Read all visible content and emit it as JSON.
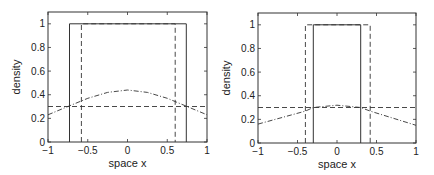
{
  "chart_data": [
    {
      "type": "line",
      "title": "",
      "xlabel": "space x",
      "ylabel": "density",
      "xlim": [
        -1,
        1
      ],
      "ylim": [
        0,
        1.1
      ],
      "xticks": [
        -1,
        -0.5,
        0,
        0.5,
        1
      ],
      "xtick_labels": [
        "−1",
        "−0.5",
        "0",
        "0.5",
        "1"
      ],
      "yticks": [
        0,
        0.2,
        0.4,
        0.6,
        0.8,
        1
      ],
      "ytick_labels": [
        "0",
        "0.2",
        "0.4",
        "0.6",
        "0.8",
        "1"
      ],
      "grid": false,
      "series": [
        {
          "name": "solid indicator",
          "style": "solid",
          "x": [
            -0.73,
            -0.73,
            0.74,
            0.74
          ],
          "y": [
            0,
            1,
            1,
            0
          ]
        },
        {
          "name": "dashed indicator",
          "style": "dashed",
          "x": [
            -0.58,
            -0.58,
            0.6,
            0.6
          ],
          "y": [
            0,
            1,
            1,
            0
          ]
        },
        {
          "name": "dashed constant",
          "style": "dashed",
          "x": [
            -1,
            1
          ],
          "y": [
            0.3,
            0.3
          ]
        },
        {
          "name": "dash-dot curve",
          "style": "dashdot",
          "x": [
            -1,
            -0.75,
            -0.5,
            -0.25,
            0,
            0.25,
            0.5,
            0.75,
            1
          ],
          "y": [
            0.23,
            0.3,
            0.37,
            0.42,
            0.44,
            0.42,
            0.37,
            0.3,
            0.23
          ]
        }
      ]
    },
    {
      "type": "line",
      "title": "",
      "xlabel": "space x",
      "ylabel": "density",
      "xlim": [
        -1,
        1
      ],
      "ylim": [
        0,
        1.1
      ],
      "xticks": [
        -1,
        -0.5,
        0,
        0.5,
        1
      ],
      "xtick_labels": [
        "−1",
        "−0.5",
        "0",
        "0.5",
        "1"
      ],
      "yticks": [
        0,
        0.2,
        0.4,
        0.6,
        0.8,
        1
      ],
      "ytick_labels": [
        "0",
        "0.2",
        "0.4",
        "0.6",
        "0.8",
        "1"
      ],
      "grid": false,
      "series": [
        {
          "name": "solid indicator",
          "style": "solid",
          "x": [
            -0.3,
            -0.3,
            0.3,
            0.3
          ],
          "y": [
            0,
            1,
            1,
            0
          ]
        },
        {
          "name": "dashed indicator",
          "style": "dashed",
          "x": [
            -0.4,
            -0.4,
            0.42,
            0.42
          ],
          "y": [
            0,
            1,
            1,
            0
          ]
        },
        {
          "name": "dashed constant",
          "style": "dashed",
          "x": [
            -1,
            1
          ],
          "y": [
            0.3,
            0.3
          ]
        },
        {
          "name": "dash-dot curve",
          "style": "dashdot",
          "x": [
            -1,
            -0.4,
            -0.3,
            0,
            0.3,
            0.42,
            1
          ],
          "y": [
            0.16,
            0.27,
            0.3,
            0.32,
            0.3,
            0.27,
            0.15
          ]
        }
      ]
    }
  ]
}
